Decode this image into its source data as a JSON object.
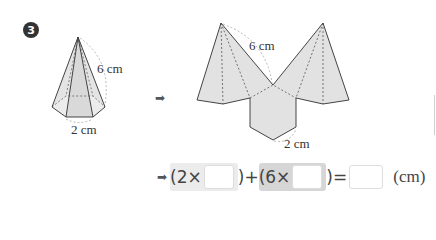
{
  "problem": {
    "number": "3",
    "pyramid": {
      "type": "hexagonal pyramid",
      "slant_label": "6 cm",
      "base_label": "2 cm"
    },
    "net": {
      "slant_label": "6 cm",
      "base_label": "2 cm"
    },
    "arrow_symbol": "➡",
    "equation": {
      "arrow": "➡",
      "open1": "(2×",
      "close1_plus": ")+",
      "open2": "(6×",
      "close2_eq": ")=",
      "unit": "(cm)",
      "blanks": [
        "",
        "",
        ""
      ]
    }
  },
  "colors": {
    "fill": "#e2e2e2",
    "stroke": "#555555",
    "highlight_light": "#ececec",
    "highlight_dark": "#d6d6d6"
  }
}
